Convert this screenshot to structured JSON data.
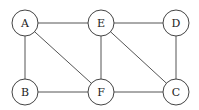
{
  "graph": {
    "nodes": [
      {
        "id": "A",
        "label": "A",
        "x": 25,
        "y": 23
      },
      {
        "id": "E",
        "label": "E",
        "x": 101,
        "y": 23
      },
      {
        "id": "D",
        "label": "D",
        "x": 176,
        "y": 23
      },
      {
        "id": "B",
        "label": "B",
        "x": 25,
        "y": 92
      },
      {
        "id": "F",
        "label": "F",
        "x": 101,
        "y": 92
      },
      {
        "id": "C",
        "label": "C",
        "x": 176,
        "y": 92
      }
    ],
    "edges": [
      [
        "A",
        "E"
      ],
      [
        "E",
        "D"
      ],
      [
        "A",
        "B"
      ],
      [
        "A",
        "F"
      ],
      [
        "E",
        "F"
      ],
      [
        "E",
        "C"
      ],
      [
        "D",
        "C"
      ],
      [
        "B",
        "F"
      ],
      [
        "F",
        "C"
      ]
    ],
    "node_radius": 13
  }
}
